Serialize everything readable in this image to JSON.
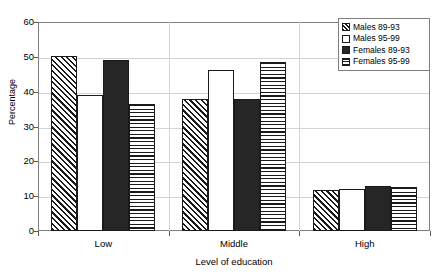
{
  "chart_data": {
    "type": "bar",
    "title": "",
    "xlabel": "Level of education",
    "ylabel": "Percentage",
    "categories": [
      "Low",
      "Middle",
      "High"
    ],
    "ylim": [
      0,
      60
    ],
    "yticks": [
      0,
      10,
      20,
      30,
      40,
      50,
      60
    ],
    "grid": true,
    "legend_position": "top-right",
    "series": [
      {
        "name": "Males 89-93",
        "pattern": "diagonal-hatch",
        "values": [
          50.2,
          38.0,
          11.9
        ]
      },
      {
        "name": "Males 95-99",
        "pattern": "white",
        "values": [
          39.0,
          46.3,
          12.2
        ]
      },
      {
        "name": "Females 89-93",
        "pattern": "solid-black",
        "values": [
          49.2,
          38.0,
          12.9
        ]
      },
      {
        "name": "Females 95-99",
        "pattern": "horizontal-lines",
        "values": [
          36.6,
          48.6,
          12.5
        ]
      }
    ]
  },
  "axes": {
    "y_title": "Percentage",
    "x_title": "Level of education",
    "y_tick_labels": [
      "60",
      "50",
      "40",
      "30",
      "20",
      "10",
      "0"
    ],
    "x_tick_labels": [
      "Low",
      "Middle",
      "High"
    ]
  },
  "legend": {
    "items": [
      {
        "label": "Males 89-93"
      },
      {
        "label": "Males 95-99"
      },
      {
        "label": "Females 89-93"
      },
      {
        "label": "Females 95-99"
      }
    ]
  }
}
